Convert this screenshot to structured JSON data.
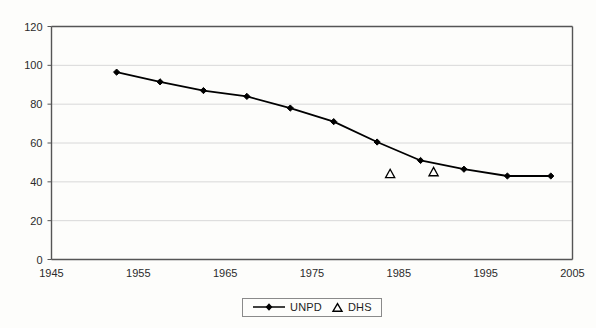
{
  "chart_data": {
    "type": "line",
    "title": "",
    "subtitle": "",
    "xlabel": "",
    "ylabel": "",
    "xlim": [
      1945,
      2005
    ],
    "ylim": [
      0,
      120
    ],
    "x_ticks": [
      1945,
      1955,
      1965,
      1975,
      1985,
      1995,
      2005
    ],
    "y_ticks": [
      0,
      20,
      40,
      60,
      80,
      100,
      120
    ],
    "grid": "horizontal",
    "legend_position": "bottom-center",
    "series": [
      {
        "name": "UNPD",
        "marker": "filled-diamond",
        "line": "solid",
        "color": "#000000",
        "points": [
          {
            "x": 1952.5,
            "y": 96.5
          },
          {
            "x": 1957.5,
            "y": 91.5
          },
          {
            "x": 1962.5,
            "y": 87.0
          },
          {
            "x": 1967.5,
            "y": 84.0
          },
          {
            "x": 1972.5,
            "y": 78.0
          },
          {
            "x": 1977.5,
            "y": 71.0
          },
          {
            "x": 1982.5,
            "y": 60.5
          },
          {
            "x": 1987.5,
            "y": 51.0
          },
          {
            "x": 1992.5,
            "y": 46.5
          },
          {
            "x": 1997.5,
            "y": 43.0
          },
          {
            "x": 2002.5,
            "y": 43.0
          }
        ]
      },
      {
        "name": "DHS",
        "marker": "hollow-triangle",
        "line": "none",
        "color": "#000000",
        "points": [
          {
            "x": 1984.0,
            "y": 44.0
          },
          {
            "x": 1989.0,
            "y": 45.0
          }
        ]
      }
    ]
  },
  "legend": {
    "items": [
      {
        "label": "UNPD",
        "symbol": "line-with-diamond-marker"
      },
      {
        "label": "DHS",
        "symbol": "hollow-triangle-marker"
      }
    ]
  },
  "colors": {
    "background": "#fdfdfb",
    "axis": "#555555",
    "gridline": "#d8d8d8",
    "series": "#000000",
    "text": "#1d1d1d"
  }
}
